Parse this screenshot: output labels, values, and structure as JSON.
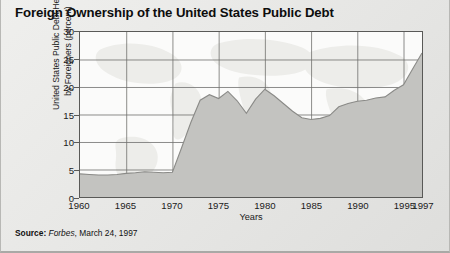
{
  "chart_title": "Foreign Ownership of the United States Public Debt",
  "source": {
    "label": "Source:",
    "publication": "Forbes",
    "rest": ", March 24, 1997"
  },
  "chart_data": {
    "type": "area",
    "title": "Foreign Ownership of the United States Public Debt",
    "xlabel": "Years",
    "ylabel": "United States Public Debt Held by Foreigners (percent)",
    "ylabel_line1": "United States Public Debt  Held",
    "ylabel_line2": "by Foreigners (percent)",
    "xlim": [
      1960,
      1997
    ],
    "ylim": [
      0,
      30
    ],
    "yticks": [
      0,
      5,
      10,
      15,
      20,
      25,
      30
    ],
    "xticks": [
      1960,
      1965,
      1970,
      1975,
      1980,
      1985,
      1990,
      1995,
      1997
    ],
    "grid": true,
    "legend": "none",
    "fill_color": "#c3c3c0",
    "line_color": "#8a8a87",
    "plot_background": "#fbfbfa",
    "axis_color": "#595957",
    "background_watermark": "world-map",
    "series": [
      {
        "name": "U.S. public debt held by foreigners",
        "x": [
          1960,
          1961,
          1962,
          1963,
          1964,
          1965,
          1966,
          1967,
          1968,
          1969,
          1970,
          1971,
          1972,
          1973,
          1974,
          1975,
          1976,
          1977,
          1978,
          1979,
          1980,
          1981,
          1982,
          1983,
          1984,
          1985,
          1986,
          1987,
          1988,
          1989,
          1990,
          1991,
          1992,
          1993,
          1994,
          1995,
          1996,
          1997
        ],
        "values": [
          4.2,
          4.1,
          4.0,
          4.0,
          4.1,
          4.3,
          4.4,
          4.6,
          4.5,
          4.4,
          4.5,
          9.0,
          13.6,
          17.6,
          18.6,
          17.9,
          19.2,
          17.5,
          15.2,
          17.8,
          19.6,
          18.4,
          17.0,
          15.6,
          14.4,
          14.1,
          14.3,
          14.8,
          16.4,
          17.0,
          17.4,
          17.6,
          18.0,
          18.2,
          19.4,
          20.4,
          23.3,
          26.2
        ]
      }
    ]
  }
}
